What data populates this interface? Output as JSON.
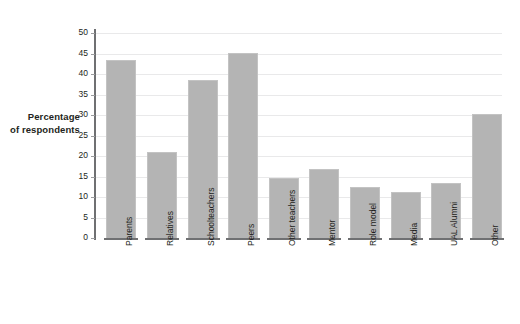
{
  "chart_data": {
    "type": "bar",
    "title": "",
    "subtitle": "",
    "xlabel": "",
    "ylabel": "Percentage of respondents",
    "ylabel_lines": [
      "Percentage",
      "of respondents"
    ],
    "ylim": [
      0,
      50
    ],
    "ytick_step": 5,
    "yticks": [
      50,
      45,
      40,
      35,
      30,
      25,
      20,
      15,
      10,
      5,
      0
    ],
    "grid": true,
    "legend": null,
    "bar_color": "#b4b4b4",
    "bar_border_color": "#c3c3c3",
    "axis_color": "#6f7072",
    "gridline_color": "#e9e9ea",
    "text_color": "#231f20",
    "categories": [
      "Parents",
      "Relatives",
      "Schoolteachers",
      "Peers",
      "Other teachers",
      "Mentor",
      "Role model",
      "Media",
      "UAL Alumni",
      "Other"
    ],
    "values": [
      43.4,
      21.1,
      38.5,
      45.2,
      14.6,
      16.9,
      12.4,
      11.2,
      13.3,
      30.2
    ]
  }
}
